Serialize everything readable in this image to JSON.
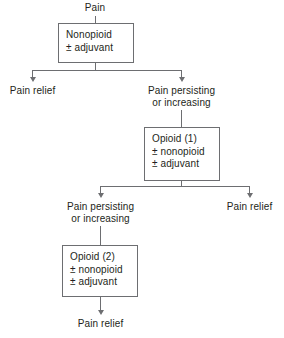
{
  "diagram": {
    "line_color": "#6d6e71",
    "text_color": "#231f20",
    "background": "#ffffff"
  },
  "nodes": {
    "start_label": "Pain",
    "box1": "Nonopioid\n± adjuvant",
    "outcome1_relief": "Pain relief",
    "outcome1_persist": "Pain persisting\nor increasing",
    "box2": "Opioid (1)\n± nonopioid\n± adjuvant",
    "outcome2_persist": "Pain persisting\nor increasing",
    "outcome2_relief": "Pain relief",
    "box3": "Opioid (2)\n± nonopioid\n± adjuvant",
    "outcome3_relief": "Pain relief"
  }
}
